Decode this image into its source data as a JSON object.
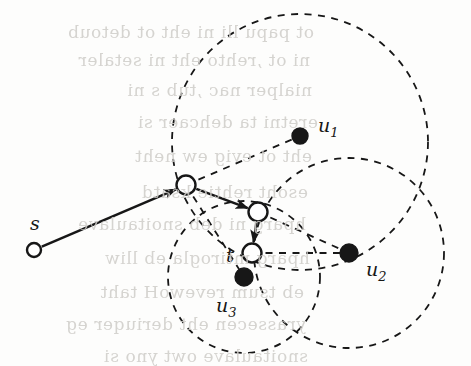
{
  "figure": {
    "background_color": "#fdfdfc",
    "ink_color": "#171717",
    "ghost_text_color": "#cfcdc9",
    "width": 471,
    "height": 366
  },
  "labels": {
    "source": "s",
    "target": "t",
    "u1": "u",
    "u1_sub": "1",
    "u2": "u",
    "u2_sub": "2",
    "u3": "u",
    "u3_sub": "3"
  },
  "chart_data": {
    "type": "scatter",
    "xlabel": "",
    "ylabel": "",
    "xlim": [
      0,
      471
    ],
    "ylim": [
      0,
      366
    ],
    "grid": false,
    "legend": "none",
    "nodes": [
      {
        "id": "s",
        "label": "s",
        "x": 34,
        "y": 250,
        "style": "open-circle",
        "r": 7,
        "label_x": 30,
        "label_y": 230
      },
      {
        "id": "v1",
        "label": "",
        "x": 186,
        "y": 185,
        "style": "open-circle",
        "r": 9.5,
        "label_x": 0,
        "label_y": 0
      },
      {
        "id": "v2",
        "label": "",
        "x": 258,
        "y": 212,
        "style": "open-circle",
        "r": 9.5,
        "label_x": 0,
        "label_y": 0
      },
      {
        "id": "t",
        "label": "t",
        "x": 252,
        "y": 253,
        "style": "open-circle",
        "r": 9.5,
        "label_x": 226,
        "label_y": 262
      },
      {
        "id": "u1",
        "label": "u1",
        "x": 300,
        "y": 136,
        "style": "filled-circle",
        "r": 8,
        "label_x": 318,
        "label_y": 132
      },
      {
        "id": "u2",
        "label": "u2",
        "x": 349,
        "y": 253,
        "style": "filled-circle",
        "r": 9,
        "label_x": 366,
        "label_y": 276
      },
      {
        "id": "u3",
        "label": "u3",
        "x": 244,
        "y": 277,
        "style": "filled-circle",
        "r": 9,
        "label_x": 216,
        "label_y": 312
      }
    ],
    "path_edges": [
      {
        "from": "s",
        "to": "v1",
        "directed": true,
        "style": "solid"
      },
      {
        "from": "v1",
        "to": "v2",
        "directed": true,
        "style": "solid"
      },
      {
        "from": "v2",
        "to": "t",
        "directed": true,
        "style": "solid"
      }
    ],
    "dashed_disks": [
      {
        "center": "u1",
        "cx": 300,
        "cy": 142,
        "r": 128
      },
      {
        "center": "u2",
        "cx": 349,
        "cy": 253,
        "r": 95
      },
      {
        "center": "u3",
        "cx": 244,
        "cy": 277,
        "r": 76
      }
    ],
    "dashed_spokes": [
      {
        "from": "v1",
        "to": "u1",
        "fx": 186,
        "fy": 185,
        "tx": 300,
        "ty": 136
      },
      {
        "from": "t",
        "to": "u2",
        "fx": 252,
        "fy": 253,
        "tx": 349,
        "ty": 253
      },
      {
        "from": "v2",
        "to": "u2",
        "fx": 258,
        "fy": 212,
        "tx": 349,
        "ty": 253
      },
      {
        "from": "v1",
        "to": "u3",
        "fx": 186,
        "fy": 185,
        "tx": 244,
        "ty": 277
      }
    ]
  },
  "ghost_text": {
    "note": "faint show-through text from the reverse side of the scanned page (mirrored, illegible)",
    "lines": [
      {
        "text": "ot papu  lli ni  eht  ot detoub",
        "x": 14,
        "y": 22,
        "size": 17
      },
      {
        "text": "ni  ot ,rehto eht ni  setaler",
        "x": 10,
        "y": 50,
        "size": 17
      },
      {
        "text": "nialper nac  ,tub  s ni",
        "x": 12,
        "y": 80,
        "size": 17
      },
      {
        "text": "eretni  ta  dehcaer  si",
        "x": 18,
        "y": 112,
        "size": 17
      },
      {
        "text": "eht  ot  evig  ew  neht",
        "x": 12,
        "y": 146,
        "size": 17
      },
      {
        "text": "esoht  rehtie  ksatd",
        "x": 8,
        "y": 182,
        "size": 17
      },
      {
        "text": "hparg  ni  deb  snoitaulave",
        "x": 6,
        "y": 214,
        "size": 17
      },
      {
        "text": "hparg  mtirogla  eb  lliw",
        "x": 10,
        "y": 248,
        "size": 17
      },
      {
        "text": "eb  tsum  revewoH  taht",
        "x": 4,
        "y": 282,
        "size": 17
      },
      {
        "text": "yrassecen  eht  deriuqer  eg",
        "x": 6,
        "y": 314,
        "size": 17
      },
      {
        "text": "snoitaulave  owt  yno  si",
        "x": 8,
        "y": 346,
        "size": 17
      }
    ]
  }
}
